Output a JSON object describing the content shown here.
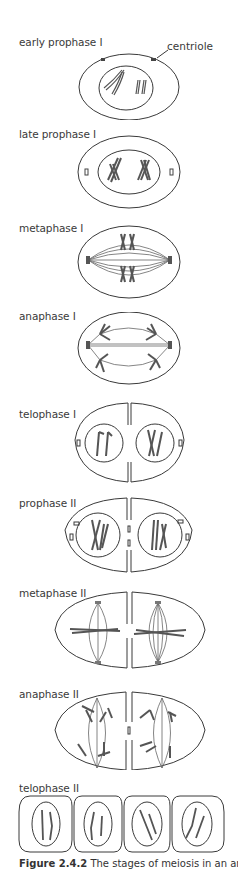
{
  "figure": {
    "caption_label": "Figure 2.4.2",
    "caption_text": "The stages of meiosis in an animal c",
    "colors": {
      "outline": "#3a3a3a",
      "chromosome": "#555555",
      "spindle": "#666666",
      "background": "#ffffff"
    }
  },
  "stages": [
    {
      "id": "early-prophase-1",
      "label": "early prophase I",
      "callout": "centriole"
    },
    {
      "id": "late-prophase-1",
      "label": "late prophase I"
    },
    {
      "id": "metaphase-1",
      "label": "metaphase I"
    },
    {
      "id": "anaphase-1",
      "label": "anaphase I"
    },
    {
      "id": "telophase-1",
      "label": "telophase I"
    },
    {
      "id": "prophase-2",
      "label": "prophase II"
    },
    {
      "id": "metaphase-2",
      "label": "metaphase II"
    },
    {
      "id": "anaphase-2",
      "label": "anaphase II"
    },
    {
      "id": "telophase-2",
      "label": "telophase II"
    }
  ]
}
